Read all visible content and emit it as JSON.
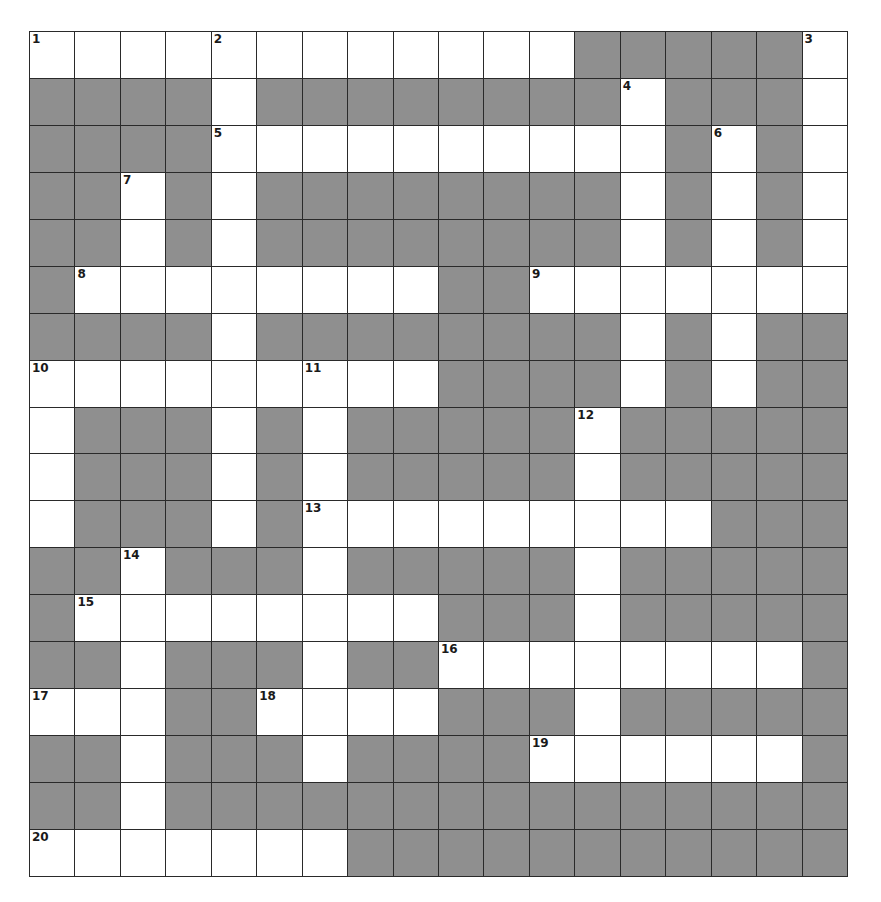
{
  "puzzle": {
    "rows": 18,
    "cols": 18,
    "colors": {
      "white": "#ffffff",
      "block": "#8f8f8f",
      "line": "#2a2a2a"
    },
    "layout": [
      "WWWWWWWWWWWW.....W",
      "....W........W...W",
      "....WWWWWWWWWW.W.W",
      "..W.W........W.W.W",
      "..W.W........W.W.W",
      ".WWWWWWWW..WWWWWWW",
      "....W........W.W..",
      "WWWWWWWWW....W.W..",
      "W...W.W.....W.....",
      "W...W.W.....W.....",
      "W...W.WWWWWWWWW...",
      "..W...W.....W.....",
      ".WWWWWWWW...W.....",
      "..W...W..WWWWWWWW.",
      "WWW..WWWW...W.....",
      "..W...W....WWWWWW.",
      "..W...............",
      "WWWWWWW..........."
    ],
    "numbers": [
      {
        "n": "1",
        "r": 0,
        "c": 0
      },
      {
        "n": "2",
        "r": 0,
        "c": 4
      },
      {
        "n": "3",
        "r": 0,
        "c": 17
      },
      {
        "n": "4",
        "r": 1,
        "c": 13
      },
      {
        "n": "5",
        "r": 2,
        "c": 4
      },
      {
        "n": "6",
        "r": 2,
        "c": 15
      },
      {
        "n": "7",
        "r": 3,
        "c": 2
      },
      {
        "n": "8",
        "r": 5,
        "c": 1
      },
      {
        "n": "9",
        "r": 5,
        "c": 11
      },
      {
        "n": "10",
        "r": 7,
        "c": 0
      },
      {
        "n": "11",
        "r": 7,
        "c": 6
      },
      {
        "n": "12",
        "r": 8,
        "c": 12
      },
      {
        "n": "13",
        "r": 10,
        "c": 6
      },
      {
        "n": "14",
        "r": 11,
        "c": 2
      },
      {
        "n": "15",
        "r": 12,
        "c": 1
      },
      {
        "n": "16",
        "r": 13,
        "c": 9
      },
      {
        "n": "17",
        "r": 14,
        "c": 0
      },
      {
        "n": "18",
        "r": 14,
        "c": 5
      },
      {
        "n": "19",
        "r": 15,
        "c": 11
      },
      {
        "n": "20",
        "r": 17,
        "c": 0
      }
    ]
  }
}
